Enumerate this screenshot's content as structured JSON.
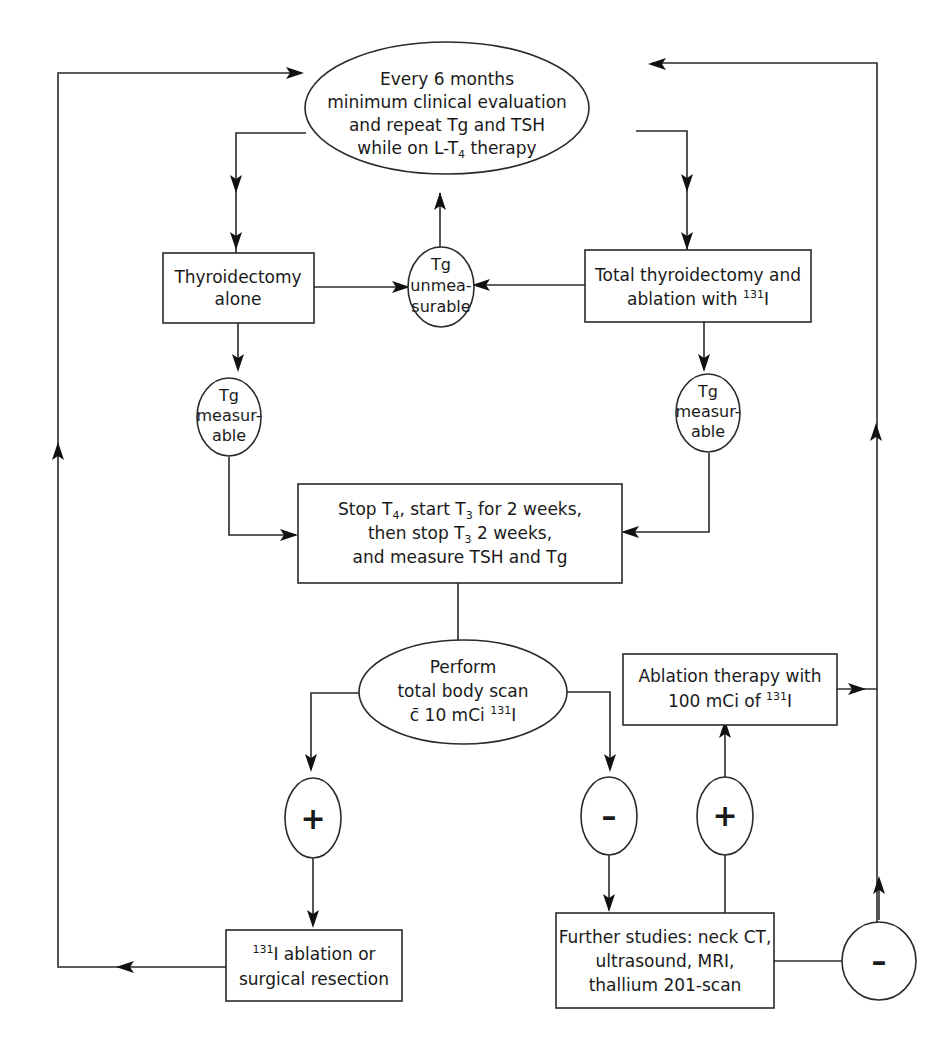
{
  "diagram": {
    "type": "flowchart",
    "nodes": {
      "followup": {
        "shape": "ellipse",
        "lines": [
          "Every 6 months",
          "minimum clinical evaluation",
          "and repeat Tg and TSH"
        ],
        "line4_pre": "while on L-T",
        "line4_sub": "4",
        "line4_post": " therapy"
      },
      "thyroidectomy_alone": {
        "shape": "rectangle",
        "lines": [
          "Thyroidectomy",
          "alone"
        ]
      },
      "tg_unmeasurable": {
        "shape": "circle",
        "lines": [
          "Tg",
          "unmea-",
          "surable"
        ]
      },
      "total_thyroidectomy": {
        "shape": "rectangle",
        "line1": "Total thyroidectomy and",
        "line2_pre": "ablation with ",
        "line2_sup": "131",
        "line2_post": "I"
      },
      "tg_measurable_left": {
        "shape": "circle",
        "lines": [
          "Tg",
          "measur-",
          "able"
        ]
      },
      "tg_measurable_right": {
        "shape": "circle",
        "lines": [
          "Tg",
          "measur-",
          "able"
        ]
      },
      "stop_t4": {
        "shape": "rectangle",
        "l1_a": "Stop T",
        "l1_sub1": "4",
        "l1_b": ", start T",
        "l1_sub2": "3",
        "l1_c": " for 2 weeks,",
        "l2_a": "then stop T",
        "l2_sub": "3",
        "l2_b": " 2 weeks,",
        "l3": "and measure TSH and Tg"
      },
      "body_scan": {
        "shape": "ellipse",
        "l1": "Perform",
        "l2": "total body scan",
        "l3_pre": "c̄ 10 mCi ",
        "l3_sup": "131",
        "l3_post": "I"
      },
      "ablation_therapy": {
        "shape": "rectangle",
        "l1": "Ablation therapy with",
        "l2_pre": "100 mCi of ",
        "l2_sup": "131",
        "l2_post": "I"
      },
      "scan_positive": {
        "shape": "circle",
        "label": "+"
      },
      "scan_negative": {
        "shape": "circle",
        "label": "–"
      },
      "further_positive": {
        "shape": "circle",
        "label": "+"
      },
      "further_negative": {
        "shape": "circle",
        "label": "–"
      },
      "ablation_or_resection": {
        "shape": "rectangle",
        "l1_sup": "131",
        "l1_post": "I ablation or",
        "l2": "surgical resection"
      },
      "further_studies": {
        "shape": "rectangle",
        "lines": [
          "Further studies: neck CT,",
          "ultrasound, MRI,",
          "thallium 201-scan"
        ]
      }
    },
    "edges": [
      [
        "followup",
        "thyroidectomy_alone"
      ],
      [
        "followup",
        "total_thyroidectomy"
      ],
      [
        "thyroidectomy_alone",
        "tg_unmeasurable"
      ],
      [
        "total_thyroidectomy",
        "tg_unmeasurable"
      ],
      [
        "tg_unmeasurable",
        "followup"
      ],
      [
        "thyroidectomy_alone",
        "tg_measurable_left"
      ],
      [
        "total_thyroidectomy",
        "tg_measurable_right"
      ],
      [
        "tg_measurable_left",
        "stop_t4"
      ],
      [
        "tg_measurable_right",
        "stop_t4"
      ],
      [
        "stop_t4",
        "body_scan"
      ],
      [
        "body_scan",
        "scan_positive"
      ],
      [
        "body_scan",
        "scan_negative"
      ],
      [
        "scan_positive",
        "ablation_or_resection"
      ],
      [
        "ablation_or_resection",
        "followup"
      ],
      [
        "scan_negative",
        "further_studies"
      ],
      [
        "further_studies",
        "further_positive"
      ],
      [
        "further_positive",
        "ablation_therapy"
      ],
      [
        "further_studies",
        "further_negative"
      ],
      [
        "further_negative",
        "followup"
      ],
      [
        "ablation_therapy",
        "followup"
      ]
    ]
  }
}
